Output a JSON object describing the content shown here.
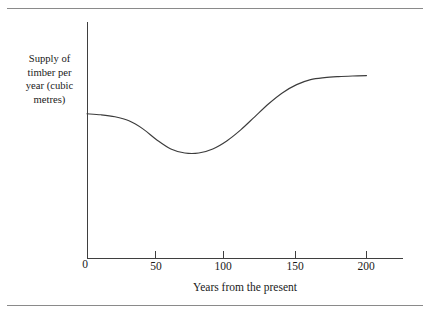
{
  "figure": {
    "background_color": "#ffffff",
    "rule_color": "#8a8a8a",
    "axis_color": "#3f3f3f",
    "curve_color": "#3c3c3c"
  },
  "chart_data": {
    "type": "line",
    "title": "",
    "subtitle": "",
    "xlabel": "Years from the present",
    "ylabel": "Supply of timber per year (cubic metres)",
    "ylabel_lines": [
      "Supply of",
      "timber per",
      "year (cubic",
      "metres)"
    ],
    "grid": false,
    "legend": false,
    "legend_position": "none",
    "xlim": [
      0,
      225
    ],
    "ylim": [
      0,
      1
    ],
    "xticks": [
      0,
      50,
      100,
      150,
      200
    ],
    "xticklabels": [
      "0",
      "50",
      "100",
      "150",
      "200"
    ],
    "yticks": [],
    "yticklabels": [],
    "origin_label": "0",
    "annotations": [],
    "series": [
      {
        "name": "Supply of timber per year",
        "x": [
          0,
          10,
          20,
          30,
          40,
          50,
          60,
          70,
          80,
          90,
          100,
          110,
          120,
          130,
          140,
          150,
          160,
          170,
          180,
          190,
          200
        ],
        "y": [
          0.72,
          0.715,
          0.705,
          0.685,
          0.645,
          0.59,
          0.545,
          0.525,
          0.525,
          0.545,
          0.585,
          0.64,
          0.705,
          0.77,
          0.825,
          0.865,
          0.89,
          0.9,
          0.905,
          0.908,
          0.91
        ]
      }
    ]
  }
}
